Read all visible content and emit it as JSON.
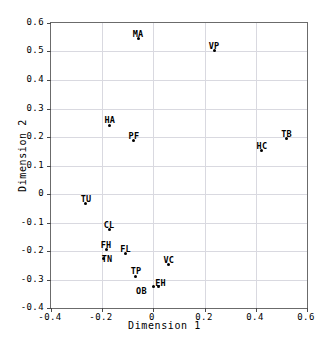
{
  "chart_data": {
    "type": "scatter",
    "title": "",
    "xlabel": "Dimension 1",
    "ylabel": "Dimension 2",
    "xlim": [
      -0.4,
      0.6
    ],
    "ylim": [
      -0.4,
      0.6
    ],
    "xticks": [
      "-0.4",
      "-0.2",
      "0",
      "0.2",
      "0.4",
      "0.6"
    ],
    "xtick_values": [
      -0.4,
      -0.2,
      0,
      0.2,
      0.4,
      0.6
    ],
    "yticks": [
      "0.6",
      "0.5",
      "0.4",
      "0.3",
      "0.2",
      "0.1",
      "0",
      "-0.1",
      "-0.2",
      "-0.3",
      "-0.4"
    ],
    "ytick_values": [
      0.6,
      0.5,
      0.4,
      0.3,
      0.2,
      0.1,
      0,
      -0.1,
      -0.2,
      -0.3,
      -0.4
    ],
    "grid": true,
    "legend": "none",
    "point_color": "#000000",
    "grid_color": "#d9d9e0",
    "axis_color": "#6b6b6b",
    "points": [
      {
        "label": "MA",
        "x": -0.06,
        "y": 0.545,
        "label_dx": 0,
        "label_dy": -9
      },
      {
        "label": "VP",
        "x": 0.237,
        "y": 0.502,
        "label_dx": 0,
        "label_dy": -9
      },
      {
        "label": "HA",
        "x": -0.17,
        "y": 0.242,
        "label_dx": 0,
        "label_dy": -9
      },
      {
        "label": "PF",
        "x": -0.076,
        "y": 0.186,
        "label_dx": 0,
        "label_dy": -9
      },
      {
        "label": "TB",
        "x": 0.52,
        "y": 0.193,
        "label_dx": 0,
        "label_dy": -9
      },
      {
        "label": "HC",
        "x": 0.424,
        "y": 0.151,
        "label_dx": 0,
        "label_dy": -9
      },
      {
        "label": "TU",
        "x": -0.267,
        "y": -0.032,
        "label_dx": 1,
        "label_dy": -8
      },
      {
        "label": "CL",
        "x": -0.173,
        "y": -0.126,
        "label_dx": 0,
        "label_dy": -9
      },
      {
        "label": "FH",
        "x": -0.185,
        "y": -0.196,
        "label_dx": 0,
        "label_dy": -9
      },
      {
        "label": "FL",
        "x": -0.109,
        "y": -0.21,
        "label_dx": 0,
        "label_dy": -9
      },
      {
        "label": "TN",
        "x": -0.193,
        "y": -0.228,
        "label_dx": 3,
        "label_dy": -4
      },
      {
        "label": "VC",
        "x": 0.06,
        "y": -0.249,
        "label_dx": 0,
        "label_dy": -9
      },
      {
        "label": "TP",
        "x": -0.068,
        "y": -0.288,
        "label_dx": 0,
        "label_dy": -9
      },
      {
        "label": "OB",
        "x": 0.0,
        "y": -0.326,
        "label_dx": -12,
        "label_dy": 0
      },
      {
        "label": "EH",
        "x": 0.02,
        "y": -0.326,
        "label_dx": 2,
        "label_dy": -8
      }
    ]
  }
}
